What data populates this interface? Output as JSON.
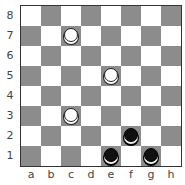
{
  "board": {
    "size": 8,
    "files": [
      "a",
      "b",
      "c",
      "d",
      "e",
      "f",
      "g",
      "h"
    ],
    "ranks": [
      "8",
      "7",
      "6",
      "5",
      "4",
      "3",
      "2",
      "1"
    ],
    "colors": {
      "light": "#ffffff",
      "dark": "#8c8c8c"
    },
    "pieces": [
      {
        "square": "c7",
        "color": "white",
        "type": "man"
      },
      {
        "square": "e5",
        "color": "white",
        "type": "man"
      },
      {
        "square": "c3",
        "color": "white",
        "type": "man"
      },
      {
        "square": "f2",
        "color": "black",
        "type": "man"
      },
      {
        "square": "e1",
        "color": "black",
        "type": "man"
      },
      {
        "square": "g1",
        "color": "black",
        "type": "man"
      }
    ]
  }
}
